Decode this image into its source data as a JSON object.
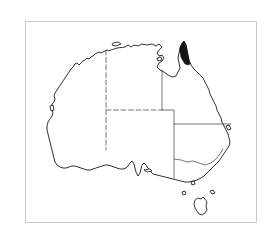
{
  "figure": {
    "type": "distribution-map",
    "region": "Australia",
    "background_color": "#ffffff",
    "frame": {
      "visible": true,
      "border_color": "#c9c9c9",
      "border_width_px": 1,
      "x": 25,
      "y": 21,
      "width": 232,
      "height": 202
    },
    "title": "",
    "caption": "",
    "legend": {
      "visible": false,
      "entries": []
    },
    "scale_bar": {
      "visible": false
    },
    "north_arrow": {
      "visible": false
    },
    "graticule": {
      "visible": false
    },
    "labels": []
  },
  "map": {
    "outline": {
      "name": "australia-mainland-coastline",
      "stroke_color": "#1a1a1a",
      "fill_color": "#ffffff",
      "stroke_width": 0.9
    },
    "islands": [
      {
        "name": "tasmania",
        "stroke_color": "#1a1a1a",
        "fill_color": "#ffffff"
      },
      {
        "name": "king-island",
        "stroke_color": "#1a1a1a",
        "fill_color": "#ffffff"
      },
      {
        "name": "flinders-island",
        "stroke_color": "#1a1a1a",
        "fill_color": "#ffffff"
      },
      {
        "name": "kangaroo-island",
        "stroke_color": "#1a1a1a",
        "fill_color": "#ffffff"
      },
      {
        "name": "melville-island",
        "stroke_color": "#1a1a1a",
        "fill_color": "#ffffff"
      },
      {
        "name": "groote-eylandt",
        "stroke_color": "#1a1a1a",
        "fill_color": "#ffffff"
      },
      {
        "name": "fraser-island",
        "stroke_color": "#1a1a1a",
        "fill_color": "#ffffff"
      },
      {
        "name": "dirk-hartog-island",
        "stroke_color": "#1a1a1a",
        "fill_color": "#ffffff"
      },
      {
        "name": "wilsons-promontory-islet",
        "stroke_color": "#1a1a1a",
        "fill_color": "#ffffff"
      }
    ],
    "state_borders": {
      "name": "state-and-territory-boundaries",
      "stroke_color": "#4a4a4a",
      "stroke_width": 0.75,
      "style": "dashed-and-solid",
      "segments": [
        {
          "name": "wa-nt-sa-vertical-border",
          "style": "dashed"
        },
        {
          "name": "nt-sa-horizontal-border",
          "style": "dashed"
        },
        {
          "name": "nt-qld-vertical-border",
          "style": "solid"
        },
        {
          "name": "sa-qld-nsw-horizontal-border",
          "style": "solid"
        },
        {
          "name": "qld-nsw-border",
          "style": "solid"
        },
        {
          "name": "nsw-vic-murray-border",
          "style": "solid"
        },
        {
          "name": "sa-nsw-vic-vertical-border",
          "style": "solid"
        }
      ]
    },
    "shaded_ranges": [
      {
        "name": "cape-york-peninsula-range",
        "description": "Filled black distribution area at the northern tip of Cape York Peninsula, Queensland",
        "fill_color": "#141414",
        "region": "Cape York Peninsula, Queensland",
        "approx_bbox": {
          "x": 172,
          "y": 27,
          "width": 18,
          "height": 26
        }
      }
    ]
  }
}
